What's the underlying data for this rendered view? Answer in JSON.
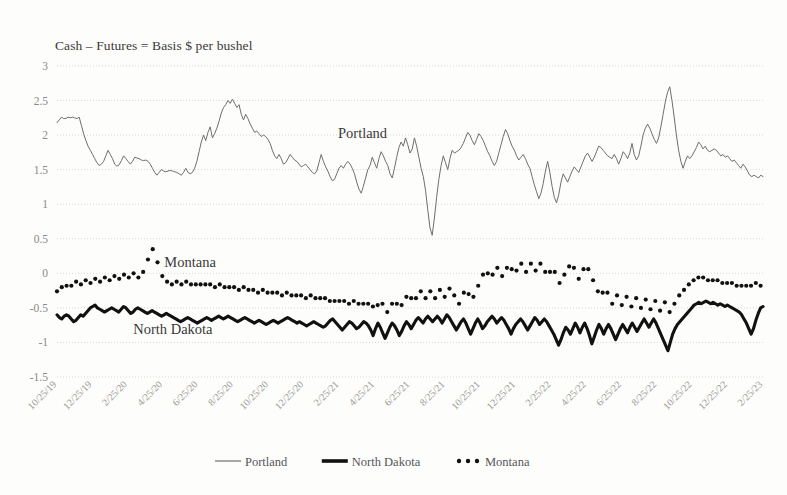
{
  "chart_data": {
    "type": "line",
    "title": "Cash – Futures = Basis $ per bushel",
    "xlabel": "",
    "ylabel": "",
    "ylim": [
      -1.5,
      3
    ],
    "yticks": [
      "3",
      "2.5",
      "2",
      "1.5",
      "1",
      "0.5",
      "0",
      "-0.5",
      "-1",
      "-1.5"
    ],
    "ytick_values": [
      3,
      2.5,
      2,
      1.5,
      1,
      0.5,
      0,
      -0.5,
      -1,
      -1.5
    ],
    "grid": true,
    "legend_position": "bottom",
    "xtick_labels": [
      "10/25/19",
      "12/25/19",
      "2/25/20",
      "4/25/20",
      "6/25/20",
      "8/25/20",
      "10/25/20",
      "12/25/20",
      "2/25/21",
      "4/25/21",
      "6/25/21",
      "8/25/21",
      "10/25/21",
      "12/25/21",
      "2/25/22",
      "4/25/22",
      "6/25/22",
      "8/25/22",
      "10/25/22",
      "12/25/22",
      "2/25/23"
    ],
    "x_start": "10/25/19",
    "x_end": "2/25/23",
    "annotations": [
      {
        "text": "Portland",
        "x_frac": 0.398,
        "y_value": 1.96
      },
      {
        "text": "Montana",
        "x_frac": 0.152,
        "y_value": 0.085
      },
      {
        "text": "North Dakota",
        "x_frac": 0.108,
        "y_value": -0.875
      }
    ],
    "series": [
      {
        "name": "Portland",
        "style": "thin-line",
        "color": "#6e6e6e",
        "values": [
          2.18,
          2.22,
          2.26,
          2.24,
          2.24,
          2.26,
          2.25,
          2.26,
          2.25,
          2.24,
          2.26,
          2.14,
          2.02,
          1.92,
          1.84,
          1.78,
          1.72,
          1.66,
          1.6,
          1.56,
          1.58,
          1.62,
          1.7,
          1.78,
          1.72,
          1.66,
          1.58,
          1.55,
          1.57,
          1.63,
          1.7,
          1.66,
          1.62,
          1.58,
          1.62,
          1.68,
          1.67,
          1.66,
          1.64,
          1.63,
          1.64,
          1.62,
          1.58,
          1.52,
          1.46,
          1.42,
          1.46,
          1.5,
          1.48,
          1.47,
          1.48,
          1.49,
          1.48,
          1.47,
          1.46,
          1.44,
          1.42,
          1.46,
          1.52,
          1.46,
          1.44,
          1.46,
          1.52,
          1.62,
          1.76,
          1.9,
          2.0,
          1.92,
          2.04,
          2.12,
          1.96,
          2.02,
          2.1,
          2.2,
          2.32,
          2.4,
          2.44,
          2.5,
          2.46,
          2.52,
          2.46,
          2.4,
          2.44,
          2.3,
          2.22,
          2.3,
          2.24,
          2.16,
          2.1,
          2.04,
          2.06,
          2.02,
          1.98,
          2.0,
          1.98,
          1.94,
          1.88,
          1.78,
          1.7,
          1.66,
          1.72,
          1.66,
          1.58,
          1.6,
          1.66,
          1.72,
          1.68,
          1.64,
          1.62,
          1.58,
          1.54,
          1.56,
          1.58,
          1.54,
          1.5,
          1.46,
          1.44,
          1.48,
          1.6,
          1.72,
          1.62,
          1.54,
          1.48,
          1.4,
          1.34,
          1.36,
          1.44,
          1.52,
          1.56,
          1.52,
          1.58,
          1.62,
          1.58,
          1.52,
          1.44,
          1.32,
          1.22,
          1.16,
          1.26,
          1.38,
          1.5,
          1.56,
          1.68,
          1.6,
          1.52,
          1.66,
          1.76,
          1.7,
          1.62,
          1.56,
          1.44,
          1.38,
          1.52,
          1.68,
          1.82,
          1.9,
          1.84,
          1.96,
          1.86,
          1.74,
          1.8,
          1.96,
          1.84,
          1.68,
          1.52,
          1.4,
          1.2,
          0.92,
          0.66,
          0.55,
          0.8,
          1.1,
          1.36,
          1.56,
          1.7,
          1.6,
          1.5,
          1.66,
          1.78,
          1.74,
          1.76,
          1.78,
          1.82,
          1.88,
          1.96,
          2.04,
          2.0,
          1.92,
          1.86,
          1.94,
          2.02,
          1.98,
          1.92,
          1.84,
          1.76,
          1.7,
          1.62,
          1.56,
          1.62,
          1.74,
          1.86,
          1.98,
          2.08,
          2.02,
          1.92,
          1.84,
          1.78,
          1.7,
          1.64,
          1.68,
          1.72,
          1.66,
          1.58,
          1.52,
          1.4,
          1.28,
          1.18,
          1.08,
          1.16,
          1.3,
          1.48,
          1.62,
          1.46,
          1.26,
          1.1,
          1.02,
          1.14,
          1.32,
          1.44,
          1.38,
          1.32,
          1.4,
          1.48,
          1.54,
          1.5,
          1.46,
          1.54,
          1.62,
          1.7,
          1.74,
          1.68,
          1.62,
          1.68,
          1.76,
          1.84,
          1.82,
          1.78,
          1.74,
          1.7,
          1.68,
          1.66,
          1.72,
          1.66,
          1.58,
          1.66,
          1.76,
          1.72,
          1.66,
          1.74,
          1.88,
          1.72,
          1.64,
          1.7,
          1.84,
          2.0,
          2.1,
          2.16,
          2.1,
          2.02,
          1.94,
          1.88,
          1.96,
          2.12,
          2.3,
          2.48,
          2.62,
          2.7,
          2.5,
          2.26,
          2.0,
          1.78,
          1.62,
          1.52,
          1.62,
          1.7,
          1.66,
          1.7,
          1.76,
          1.82,
          1.9,
          1.86,
          1.8,
          1.84,
          1.78,
          1.76,
          1.78,
          1.8,
          1.78,
          1.74,
          1.7,
          1.72,
          1.68,
          1.7,
          1.66,
          1.62,
          1.64,
          1.6,
          1.56,
          1.52,
          1.58,
          1.54,
          1.48,
          1.42,
          1.4,
          1.42,
          1.4,
          1.38,
          1.42,
          1.4
        ]
      },
      {
        "name": "North Dakota",
        "style": "thick-line",
        "color": "#111111",
        "values": [
          -0.6,
          -0.64,
          -0.66,
          -0.62,
          -0.6,
          -0.62,
          -0.66,
          -0.7,
          -0.68,
          -0.64,
          -0.6,
          -0.62,
          -0.58,
          -0.54,
          -0.5,
          -0.48,
          -0.46,
          -0.5,
          -0.52,
          -0.54,
          -0.56,
          -0.54,
          -0.52,
          -0.5,
          -0.52,
          -0.54,
          -0.56,
          -0.52,
          -0.48,
          -0.5,
          -0.54,
          -0.58,
          -0.56,
          -0.52,
          -0.5,
          -0.52,
          -0.54,
          -0.56,
          -0.58,
          -0.56,
          -0.54,
          -0.56,
          -0.58,
          -0.6,
          -0.62,
          -0.6,
          -0.58,
          -0.6,
          -0.62,
          -0.64,
          -0.66,
          -0.68,
          -0.7,
          -0.68,
          -0.66,
          -0.64,
          -0.66,
          -0.68,
          -0.7,
          -0.72,
          -0.7,
          -0.68,
          -0.66,
          -0.64,
          -0.66,
          -0.68,
          -0.66,
          -0.64,
          -0.62,
          -0.64,
          -0.66,
          -0.64,
          -0.62,
          -0.64,
          -0.66,
          -0.68,
          -0.7,
          -0.68,
          -0.66,
          -0.64,
          -0.66,
          -0.68,
          -0.7,
          -0.72,
          -0.7,
          -0.68,
          -0.7,
          -0.72,
          -0.74,
          -0.72,
          -0.7,
          -0.68,
          -0.7,
          -0.72,
          -0.7,
          -0.68,
          -0.66,
          -0.64,
          -0.66,
          -0.68,
          -0.7,
          -0.72,
          -0.7,
          -0.72,
          -0.74,
          -0.76,
          -0.74,
          -0.72,
          -0.7,
          -0.72,
          -0.74,
          -0.76,
          -0.78,
          -0.76,
          -0.72,
          -0.68,
          -0.66,
          -0.7,
          -0.74,
          -0.78,
          -0.82,
          -0.78,
          -0.74,
          -0.7,
          -0.72,
          -0.76,
          -0.8,
          -0.78,
          -0.74,
          -0.7,
          -0.72,
          -0.76,
          -0.82,
          -0.9,
          -0.8,
          -0.72,
          -0.78,
          -0.86,
          -0.94,
          -0.86,
          -0.78,
          -0.72,
          -0.76,
          -0.82,
          -0.9,
          -0.84,
          -0.76,
          -0.7,
          -0.74,
          -0.8,
          -0.74,
          -0.68,
          -0.64,
          -0.68,
          -0.72,
          -0.66,
          -0.62,
          -0.66,
          -0.7,
          -0.66,
          -0.62,
          -0.66,
          -0.72,
          -0.66,
          -0.6,
          -0.64,
          -0.7,
          -0.76,
          -0.82,
          -0.76,
          -0.7,
          -0.66,
          -0.72,
          -0.8,
          -0.88,
          -0.8,
          -0.72,
          -0.66,
          -0.72,
          -0.8,
          -0.76,
          -0.7,
          -0.66,
          -0.62,
          -0.66,
          -0.72,
          -0.68,
          -0.64,
          -0.68,
          -0.74,
          -0.8,
          -0.88,
          -0.8,
          -0.74,
          -0.7,
          -0.66,
          -0.7,
          -0.76,
          -0.82,
          -0.76,
          -0.7,
          -0.64,
          -0.68,
          -0.74,
          -0.7,
          -0.66,
          -0.7,
          -0.76,
          -0.82,
          -0.88,
          -0.96,
          -1.04,
          -0.96,
          -0.86,
          -0.78,
          -0.82,
          -0.88,
          -0.8,
          -0.72,
          -0.78,
          -0.86,
          -0.78,
          -0.72,
          -0.8,
          -0.9,
          -1.02,
          -0.92,
          -0.82,
          -0.74,
          -0.8,
          -0.88,
          -0.8,
          -0.74,
          -0.8,
          -0.88,
          -0.96,
          -0.88,
          -0.8,
          -0.74,
          -0.8,
          -0.86,
          -0.78,
          -0.72,
          -0.78,
          -0.84,
          -0.78,
          -0.72,
          -0.66,
          -0.72,
          -0.78,
          -0.72,
          -0.66,
          -0.72,
          -0.8,
          -0.88,
          -0.96,
          -1.04,
          -1.12,
          -1.0,
          -0.88,
          -0.8,
          -0.74,
          -0.7,
          -0.66,
          -0.62,
          -0.58,
          -0.54,
          -0.5,
          -0.46,
          -0.44,
          -0.42,
          -0.44,
          -0.42,
          -0.4,
          -0.42,
          -0.44,
          -0.42,
          -0.44,
          -0.46,
          -0.44,
          -0.46,
          -0.48,
          -0.46,
          -0.48,
          -0.5,
          -0.52,
          -0.54,
          -0.56,
          -0.6,
          -0.66,
          -0.72,
          -0.8,
          -0.88,
          -0.8,
          -0.68,
          -0.58,
          -0.5,
          -0.48
        ]
      },
      {
        "name": "Montana",
        "style": "dotted",
        "color": "#111111",
        "values": [
          -0.26,
          -0.22,
          -0.2,
          -0.22,
          -0.18,
          -0.16,
          -0.18,
          -0.14,
          -0.12,
          -0.14,
          -0.16,
          -0.12,
          -0.1,
          -0.12,
          -0.14,
          -0.1,
          -0.08,
          -0.1,
          -0.12,
          -0.08,
          -0.06,
          -0.08,
          -0.1,
          -0.06,
          -0.04,
          -0.06,
          -0.08,
          -0.04,
          -0.02,
          -0.04,
          -0.06,
          -0.02,
          0.0,
          -0.04,
          -0.06,
          -0.02,
          0.02,
          0.1,
          0.2,
          0.3,
          0.35,
          0.28,
          0.16,
          0.04,
          -0.04,
          -0.08,
          -0.12,
          -0.14,
          -0.16,
          -0.14,
          -0.12,
          -0.14,
          -0.16,
          -0.14,
          -0.12,
          -0.14,
          -0.16,
          -0.18,
          -0.16,
          -0.14,
          -0.16,
          -0.18,
          -0.16,
          -0.14,
          -0.16,
          -0.18,
          -0.2,
          -0.18,
          -0.16,
          -0.18,
          -0.2,
          -0.22,
          -0.2,
          -0.18,
          -0.2,
          -0.22,
          -0.24,
          -0.22,
          -0.2,
          -0.22,
          -0.24,
          -0.26,
          -0.24,
          -0.26,
          -0.28,
          -0.26,
          -0.24,
          -0.26,
          -0.28,
          -0.3,
          -0.28,
          -0.26,
          -0.28,
          -0.3,
          -0.32,
          -0.3,
          -0.28,
          -0.3,
          -0.32,
          -0.34,
          -0.32,
          -0.3,
          -0.32,
          -0.34,
          -0.36,
          -0.34,
          -0.32,
          -0.34,
          -0.36,
          -0.38,
          -0.36,
          -0.34,
          -0.36,
          -0.38,
          -0.4,
          -0.38,
          -0.4,
          -0.42,
          -0.4,
          -0.38,
          -0.4,
          -0.42,
          -0.44,
          -0.42,
          -0.4,
          -0.42,
          -0.44,
          -0.46,
          -0.44,
          -0.42,
          -0.44,
          -0.46,
          -0.48,
          -0.52,
          -0.46,
          -0.4,
          -0.44,
          -0.5,
          -0.56,
          -0.5,
          -0.44,
          -0.4,
          -0.44,
          -0.5,
          -0.46,
          -0.4,
          -0.34,
          -0.3,
          -0.36,
          -0.42,
          -0.36,
          -0.3,
          -0.26,
          -0.3,
          -0.36,
          -0.3,
          -0.26,
          -0.3,
          -0.36,
          -0.3,
          -0.24,
          -0.28,
          -0.34,
          -0.28,
          -0.22,
          -0.26,
          -0.32,
          -0.38,
          -0.44,
          -0.36,
          -0.28,
          -0.22,
          -0.3,
          -0.4,
          -0.34,
          -0.26,
          -0.18,
          -0.1,
          -0.02,
          0.04,
          0.0,
          -0.08,
          -0.02,
          0.04,
          0.08,
          0.02,
          -0.04,
          0.02,
          0.08,
          0.12,
          0.06,
          -0.02,
          0.04,
          0.1,
          0.14,
          0.08,
          0.02,
          0.08,
          0.14,
          0.1,
          0.04,
          0.1,
          0.14,
          0.08,
          0.02,
          -0.04,
          0.02,
          0.08,
          0.02,
          -0.06,
          -0.14,
          -0.08,
          -0.02,
          0.04,
          0.1,
          0.14,
          0.08,
          0.0,
          -0.08,
          -0.02,
          0.06,
          0.12,
          0.06,
          -0.02,
          -0.1,
          -0.18,
          -0.26,
          -0.34,
          -0.28,
          -0.22,
          -0.28,
          -0.36,
          -0.44,
          -0.38,
          -0.32,
          -0.38,
          -0.46,
          -0.4,
          -0.34,
          -0.4,
          -0.48,
          -0.42,
          -0.36,
          -0.42,
          -0.5,
          -0.44,
          -0.38,
          -0.44,
          -0.52,
          -0.46,
          -0.4,
          -0.46,
          -0.54,
          -0.48,
          -0.42,
          -0.48,
          -0.56,
          -0.5,
          -0.44,
          -0.38,
          -0.32,
          -0.28,
          -0.24,
          -0.2,
          -0.16,
          -0.12,
          -0.1,
          -0.08,
          -0.06,
          -0.08,
          -0.06,
          -0.08,
          -0.1,
          -0.08,
          -0.1,
          -0.12,
          -0.1,
          -0.12,
          -0.14,
          -0.12,
          -0.14,
          -0.16,
          -0.14,
          -0.16,
          -0.18,
          -0.16,
          -0.18,
          -0.2,
          -0.18,
          -0.16,
          -0.18,
          -0.16,
          -0.14,
          -0.16,
          -0.18,
          -0.16
        ]
      }
    ]
  },
  "legend": {
    "items": [
      {
        "label": "Portland",
        "marker": "thin-line-swatch"
      },
      {
        "label": "North Dakota",
        "marker": "thick-line-swatch"
      },
      {
        "label": "Montana",
        "marker": "dotted-swatch"
      }
    ]
  }
}
